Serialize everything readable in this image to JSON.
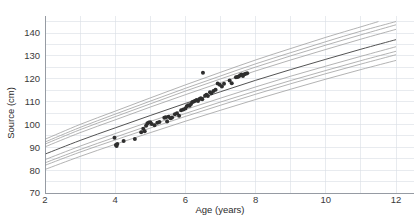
{
  "chart_data": {
    "type": "scatter",
    "title": "",
    "xlabel": "Age (years)",
    "ylabel": "Source (cm)",
    "xlim": [
      2,
      12
    ],
    "ylim": [
      70,
      145
    ],
    "xticks": [
      2,
      4,
      6,
      8,
      10,
      12
    ],
    "yticks": [
      70,
      80,
      90,
      100,
      110,
      120,
      130,
      140
    ],
    "xtick_labels": [
      "2",
      "4",
      "6",
      "8",
      "10",
      "12"
    ],
    "ytick_labels": [
      "70",
      "80",
      "90",
      "100",
      "110",
      "120",
      "130",
      "140"
    ],
    "grid": true,
    "legend": "none",
    "point_color": "#2e2e2e",
    "curve_color": "#9a9a9a",
    "median_curve_color": "#4a4a4a",
    "grid_color": "#d9dde4",
    "reference_curves": [
      {
        "name": "P97",
        "style": "light",
        "points": [
          [
            2,
            93.5
          ],
          [
            3,
            100.0
          ],
          [
            4,
            105.8
          ],
          [
            5,
            111.6
          ],
          [
            6,
            117.3
          ],
          [
            7,
            122.8
          ],
          [
            8,
            128.2
          ],
          [
            9,
            133.2
          ],
          [
            10,
            138.1
          ],
          [
            11,
            142.7
          ],
          [
            11.5,
            145.0
          ]
        ]
      },
      {
        "name": "P90",
        "style": "light",
        "points": [
          [
            2,
            92.3
          ],
          [
            3,
            98.7
          ],
          [
            4,
            104.5
          ],
          [
            5,
            110.2
          ],
          [
            6,
            115.8
          ],
          [
            7,
            121.2
          ],
          [
            8,
            126.5
          ],
          [
            9,
            131.4
          ],
          [
            10,
            136.2
          ],
          [
            11,
            140.8
          ],
          [
            12,
            145.0
          ]
        ]
      },
      {
        "name": "P85",
        "style": "light",
        "points": [
          [
            2,
            91.4
          ],
          [
            3,
            97.7
          ],
          [
            4,
            103.4
          ],
          [
            5,
            109.0
          ],
          [
            6,
            114.6
          ],
          [
            7,
            119.9
          ],
          [
            8,
            125.1
          ],
          [
            9,
            130.0
          ],
          [
            10,
            134.7
          ],
          [
            11,
            139.2
          ],
          [
            12,
            143.6
          ]
        ]
      },
      {
        "name": "P75",
        "style": "light",
        "points": [
          [
            2,
            90.2
          ],
          [
            3,
            96.4
          ],
          [
            4,
            102.0
          ],
          [
            5,
            107.6
          ],
          [
            6,
            113.0
          ],
          [
            7,
            118.3
          ],
          [
            8,
            123.4
          ],
          [
            9,
            128.2
          ],
          [
            10,
            132.8
          ],
          [
            11,
            137.3
          ],
          [
            12,
            141.6
          ]
        ]
      },
      {
        "name": "P50",
        "style": "median",
        "points": [
          [
            2,
            87.0
          ],
          [
            3,
            93.0
          ],
          [
            4,
            98.5
          ],
          [
            5,
            103.9
          ],
          [
            6,
            109.2
          ],
          [
            7,
            114.3
          ],
          [
            8,
            119.3
          ],
          [
            9,
            124.0
          ],
          [
            10,
            128.5
          ],
          [
            11,
            132.9
          ],
          [
            12,
            137.1
          ]
        ]
      },
      {
        "name": "P25",
        "style": "light",
        "points": [
          [
            2,
            84.6
          ],
          [
            3,
            90.5
          ],
          [
            4,
            96.0
          ],
          [
            5,
            101.3
          ],
          [
            6,
            106.5
          ],
          [
            7,
            111.5
          ],
          [
            8,
            116.4
          ],
          [
            9,
            121.1
          ],
          [
            10,
            125.5
          ],
          [
            11,
            129.8
          ],
          [
            12,
            134.0
          ]
        ]
      },
      {
        "name": "P15",
        "style": "light",
        "points": [
          [
            2,
            83.2
          ],
          [
            3,
            89.0
          ],
          [
            4,
            94.4
          ],
          [
            5,
            99.7
          ],
          [
            6,
            104.8
          ],
          [
            7,
            109.8
          ],
          [
            8,
            114.6
          ],
          [
            9,
            119.2
          ],
          [
            10,
            123.6
          ],
          [
            11,
            127.9
          ],
          [
            12,
            132.0
          ]
        ]
      },
      {
        "name": "P10",
        "style": "light",
        "points": [
          [
            2,
            82.1
          ],
          [
            3,
            87.9
          ],
          [
            4,
            93.2
          ],
          [
            5,
            98.4
          ],
          [
            6,
            103.5
          ],
          [
            7,
            108.4
          ],
          [
            8,
            113.2
          ],
          [
            9,
            117.8
          ],
          [
            10,
            122.2
          ],
          [
            11,
            126.4
          ],
          [
            12,
            130.5
          ]
        ]
      },
      {
        "name": "P3",
        "style": "light",
        "points": [
          [
            2,
            80.3
          ],
          [
            3,
            86.0
          ],
          [
            4,
            91.3
          ],
          [
            5,
            96.4
          ],
          [
            6,
            101.4
          ],
          [
            7,
            106.2
          ],
          [
            8,
            110.9
          ],
          [
            9,
            115.4
          ],
          [
            10,
            119.8
          ],
          [
            11,
            124.0
          ],
          [
            12,
            128.0
          ]
        ]
      }
    ],
    "points": [
      [
        3.98,
        94.2
      ],
      [
        4.02,
        91.0
      ],
      [
        4.04,
        90.6
      ],
      [
        4.06,
        91.4
      ],
      [
        4.24,
        92.8
      ],
      [
        4.56,
        93.6
      ],
      [
        4.74,
        96.6
      ],
      [
        4.8,
        98.1
      ],
      [
        4.84,
        97.0
      ],
      [
        4.88,
        99.4
      ],
      [
        4.92,
        100.5
      ],
      [
        4.96,
        100.8
      ],
      [
        5.0,
        101.0
      ],
      [
        5.04,
        100.2
      ],
      [
        5.12,
        99.6
      ],
      [
        5.2,
        100.7
      ],
      [
        5.26,
        101.1
      ],
      [
        5.4,
        102.9
      ],
      [
        5.44,
        103.1
      ],
      [
        5.48,
        101.3
      ],
      [
        5.52,
        103.4
      ],
      [
        5.58,
        102.7
      ],
      [
        5.62,
        103.0
      ],
      [
        5.7,
        104.4
      ],
      [
        5.76,
        104.9
      ],
      [
        5.82,
        103.8
      ],
      [
        5.88,
        106.2
      ],
      [
        5.94,
        106.5
      ],
      [
        6.0,
        107.0
      ],
      [
        6.04,
        107.9
      ],
      [
        6.08,
        108.4
      ],
      [
        6.12,
        108.2
      ],
      [
        6.16,
        108.9
      ],
      [
        6.2,
        109.8
      ],
      [
        6.24,
        110.0
      ],
      [
        6.28,
        110.4
      ],
      [
        6.32,
        110.7
      ],
      [
        6.36,
        110.3
      ],
      [
        6.4,
        111.1
      ],
      [
        6.44,
        111.5
      ],
      [
        6.48,
        111.0
      ],
      [
        6.5,
        122.6
      ],
      [
        6.56,
        112.6
      ],
      [
        6.6,
        113.0
      ],
      [
        6.64,
        112.4
      ],
      [
        6.7,
        114.1
      ],
      [
        6.74,
        113.6
      ],
      [
        6.8,
        114.6
      ],
      [
        6.86,
        115.2
      ],
      [
        6.92,
        117.9
      ],
      [
        6.98,
        117.4
      ],
      [
        7.04,
        116.6
      ],
      [
        7.1,
        117.8
      ],
      [
        7.26,
        119.2
      ],
      [
        7.32,
        118.0
      ],
      [
        7.44,
        120.6
      ],
      [
        7.48,
        120.8
      ],
      [
        7.52,
        121.0
      ],
      [
        7.56,
        121.5
      ],
      [
        7.6,
        121.8
      ],
      [
        7.64,
        121.2
      ],
      [
        7.68,
        122.0
      ],
      [
        7.72,
        122.2
      ],
      [
        7.76,
        122.4
      ]
    ]
  }
}
